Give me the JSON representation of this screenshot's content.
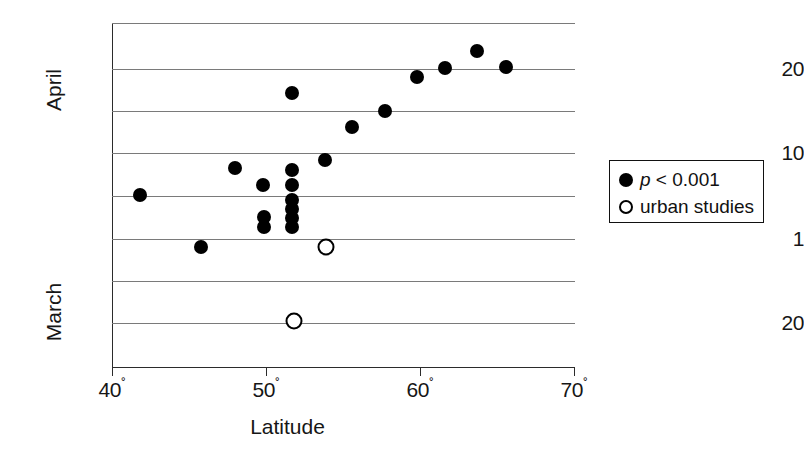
{
  "chart_data": {
    "type": "scatter",
    "title": "",
    "xlabel": "Latitude",
    "ylabel": "",
    "xlim": [
      38.6,
      70.3
    ],
    "x_ticks": [
      {
        "value": 40,
        "label": "40",
        "degree": "˚"
      },
      {
        "value": 50,
        "label": "50",
        "degree": "˚"
      },
      {
        "value": 60,
        "label": "60",
        "degree": "˚"
      },
      {
        "value": 70,
        "label": "70",
        "degree": "˚"
      }
    ],
    "y_axis_groups": [
      {
        "name": "April",
        "label": "April"
      },
      {
        "name": "March",
        "label": "March"
      }
    ],
    "y_ticks": [
      {
        "label": "20",
        "group": "April",
        "pixel_y": 69
      },
      {
        "label": "10",
        "group": "April",
        "pixel_y": 153
      },
      {
        "label": "1",
        "group": "April",
        "pixel_y": 239
      },
      {
        "label": "20",
        "group": "March",
        "pixel_y": 323
      }
    ],
    "gridlines_y": [
      23,
      69,
      111,
      153,
      196,
      239,
      281,
      323,
      367
    ],
    "grid": true,
    "legend_position": "right",
    "legend": [
      {
        "marker": "filled-circle",
        "label": "p < 0.001",
        "italic_prefix": "p",
        "rest": " < 0.001"
      },
      {
        "marker": "open-circle",
        "label": "urban studies"
      }
    ],
    "series": [
      {
        "name": "p < 0.001",
        "marker": "filled-circle",
        "points": [
          {
            "latitude": 41.8,
            "py": 195
          },
          {
            "latitude": 45.8,
            "py": 247
          },
          {
            "latitude": 48.0,
            "py": 168
          },
          {
            "latitude": 49.8,
            "py": 185
          },
          {
            "latitude": 49.9,
            "py": 217
          },
          {
            "latitude": 49.9,
            "py": 227
          },
          {
            "latitude": 51.7,
            "py": 93
          },
          {
            "latitude": 51.7,
            "py": 170
          },
          {
            "latitude": 51.7,
            "py": 185
          },
          {
            "latitude": 51.7,
            "py": 200
          },
          {
            "latitude": 51.7,
            "py": 209
          },
          {
            "latitude": 51.7,
            "py": 218
          },
          {
            "latitude": 51.7,
            "py": 227
          },
          {
            "latitude": 53.8,
            "py": 160
          },
          {
            "latitude": 55.6,
            "py": 127
          },
          {
            "latitude": 57.7,
            "py": 111
          },
          {
            "latitude": 59.8,
            "py": 77
          },
          {
            "latitude": 61.6,
            "py": 68
          },
          {
            "latitude": 63.7,
            "py": 51
          },
          {
            "latitude": 65.6,
            "py": 67
          }
        ]
      },
      {
        "name": "urban studies",
        "marker": "open-circle",
        "points": [
          {
            "latitude": 53.9,
            "py": 247
          },
          {
            "latitude": 51.8,
            "py": 321
          }
        ]
      }
    ]
  },
  "axis": {
    "y_april": "April",
    "y_march": "March",
    "x_title": "Latitude"
  }
}
